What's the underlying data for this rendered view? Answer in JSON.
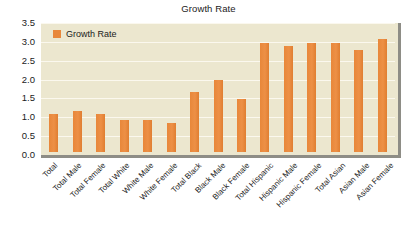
{
  "chart_data": {
    "type": "bar",
    "title": "Growth Rate",
    "xlabel": "",
    "ylabel": "",
    "ylim": [
      0.0,
      3.5
    ],
    "yticks": [
      "0.0",
      "0.5",
      "1.0",
      "1.5",
      "2.0",
      "2.5",
      "3.0",
      "3.5"
    ],
    "grid": true,
    "legend": {
      "position": "top-left",
      "entries": [
        {
          "name": "Growth Rate",
          "color": "#e8873a"
        }
      ]
    },
    "categories": [
      "Total",
      "Total Male",
      "Total Female",
      "Total White",
      "White Male",
      "White Female",
      "Total Black",
      "Black Male",
      "Black Female",
      "Total Hispanic",
      "Hispanic Male",
      "Hispanic Female",
      "Total Asian",
      "Asian Male",
      "Asian Female"
    ],
    "series": [
      {
        "name": "Growth Rate",
        "color": "#e8873a",
        "values": [
          1.0,
          1.1,
          1.0,
          0.85,
          0.85,
          0.78,
          1.6,
          1.9,
          1.4,
          2.9,
          2.8,
          2.9,
          2.9,
          2.7,
          3.0
        ]
      }
    ]
  },
  "colors": {
    "bar": "#e8873a",
    "plot_background": "#ece7cf",
    "gridline": "#fbf8ee",
    "border": "#8e8d86",
    "text": "#1b1b1b",
    "page_background": "#ffffff"
  }
}
